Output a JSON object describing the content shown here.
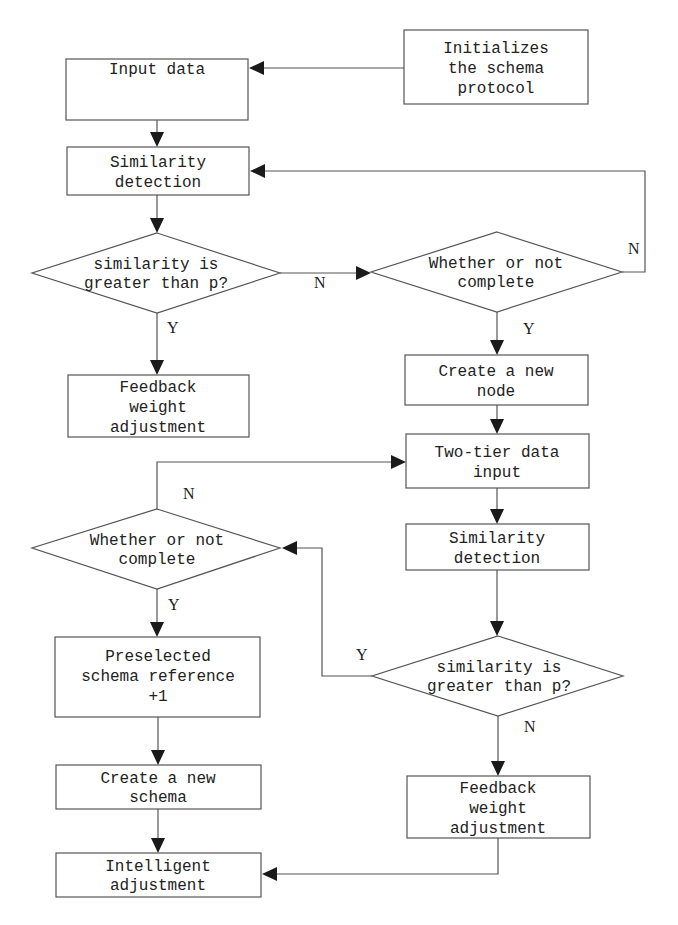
{
  "diagram": {
    "type": "flowchart",
    "nodes": {
      "init": {
        "kind": "process",
        "lines": [
          "Initializes",
          "the schema",
          "protocol"
        ]
      },
      "input": {
        "kind": "process",
        "lines": [
          "Input data"
        ]
      },
      "sim1": {
        "kind": "process",
        "lines": [
          "Similarity",
          "detection"
        ]
      },
      "dec1": {
        "kind": "decision",
        "lines": [
          "similarity is",
          "greater than p?"
        ]
      },
      "fb1": {
        "kind": "process",
        "lines": [
          "Feedback",
          "weight",
          "adjustment"
        ]
      },
      "dec2": {
        "kind": "decision",
        "lines": [
          "Whether or not",
          "complete"
        ]
      },
      "newnode": {
        "kind": "process",
        "lines": [
          "Create a new",
          "node"
        ]
      },
      "twotier": {
        "kind": "process",
        "lines": [
          "Two-tier data",
          "input"
        ]
      },
      "sim2": {
        "kind": "process",
        "lines": [
          "Similarity",
          "detection"
        ]
      },
      "dec3": {
        "kind": "decision",
        "lines": [
          "similarity is",
          "greater than p?"
        ]
      },
      "fb2": {
        "kind": "process",
        "lines": [
          "Feedback",
          "weight",
          "adjustment"
        ]
      },
      "dec4": {
        "kind": "decision",
        "lines": [
          "Whether or not",
          "complete"
        ]
      },
      "presel": {
        "kind": "process",
        "lines": [
          "Preselected",
          "schema reference",
          "+1"
        ]
      },
      "newschema": {
        "kind": "process",
        "lines": [
          "Create a new",
          "schema"
        ]
      },
      "intel": {
        "kind": "process",
        "lines": [
          "Intelligent",
          "adjustment"
        ]
      }
    },
    "edge_labels": {
      "dec1_no": "N",
      "dec1_yes": "Y",
      "dec2_no": "N",
      "dec2_yes": "Y",
      "dec3_yes": "Y",
      "dec3_no": "N",
      "dec4_no": "N",
      "dec4_yes": "Y"
    },
    "edges": [
      {
        "from": "init",
        "to": "input"
      },
      {
        "from": "input",
        "to": "sim1"
      },
      {
        "from": "sim1",
        "to": "dec1"
      },
      {
        "from": "dec1",
        "to": "fb1",
        "label": "Y"
      },
      {
        "from": "dec1",
        "to": "dec2",
        "label": "N"
      },
      {
        "from": "dec2",
        "to": "sim1",
        "label": "N"
      },
      {
        "from": "dec2",
        "to": "newnode",
        "label": "Y"
      },
      {
        "from": "newnode",
        "to": "twotier"
      },
      {
        "from": "twotier",
        "to": "sim2"
      },
      {
        "from": "sim2",
        "to": "dec3"
      },
      {
        "from": "dec3",
        "to": "dec4",
        "label": "Y"
      },
      {
        "from": "dec3",
        "to": "fb2",
        "label": "N"
      },
      {
        "from": "dec4",
        "to": "twotier",
        "label": "N"
      },
      {
        "from": "dec4",
        "to": "presel",
        "label": "Y"
      },
      {
        "from": "presel",
        "to": "newschema"
      },
      {
        "from": "newschema",
        "to": "intel"
      },
      {
        "from": "fb2",
        "to": "intel"
      }
    ]
  }
}
